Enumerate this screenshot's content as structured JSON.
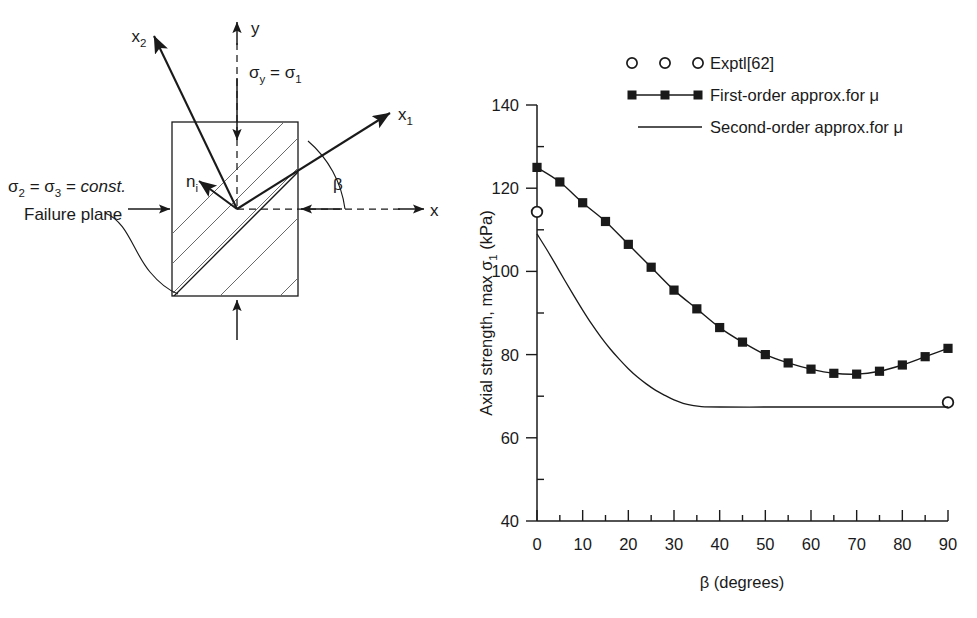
{
  "figure": {
    "background": "#ffffff",
    "line_color": "#1a1a1a",
    "hatch_color": "#6a6a6a"
  },
  "diagram": {
    "labels": {
      "x2": "x",
      "x2_sub": "2",
      "x1": "x",
      "x1_sub": "1",
      "y_axis": "y",
      "x_axis": "x",
      "sigma_y": "σ",
      "sigma_y_sub": "y",
      "sigma_y_eq": " = ",
      "sigma_1": "σ",
      "sigma_1_sub": "1",
      "sigma_2": "σ",
      "sigma_2_sub": "2",
      "eq1": " = ",
      "sigma_3": "σ",
      "sigma_3_sub": "3",
      "eq2": " = ",
      "const": "const.",
      "normal": "n",
      "normal_sub": "i",
      "beta": "β",
      "failure_plane": "Failure plane"
    }
  },
  "chart_data": {
    "type": "line",
    "title": "",
    "xlabel_text": "β (degrees)",
    "ylabel_parts": {
      "pre": "Axial strength, max ",
      "sigma": "σ",
      "sub": "1",
      "post": " (kPa)"
    },
    "xlim": [
      0,
      90
    ],
    "ylim": [
      40,
      140
    ],
    "xticks": [
      0,
      10,
      20,
      30,
      40,
      50,
      60,
      70,
      80,
      90
    ],
    "xtick_labels": [
      "0",
      "10",
      "20",
      "30",
      "40",
      "50",
      "60",
      "70",
      "80",
      "90"
    ],
    "xminor_step": 5,
    "yticks": [
      40,
      60,
      80,
      100,
      120,
      140
    ],
    "ytick_labels": [
      "40",
      "60",
      "80",
      "100",
      "120",
      "140"
    ],
    "yminor_step": 10,
    "grid": false,
    "legend_position": "top-right",
    "series": [
      {
        "name": "Exptl[62]",
        "style": "markers-only",
        "marker": "open-circle",
        "x": [
          0,
          90
        ],
        "values": [
          114.3,
          68.5
        ]
      },
      {
        "name": "First-order approx.for μ",
        "style": "line-markers",
        "marker": "filled-square",
        "x": [
          0,
          5,
          10,
          15,
          20,
          25,
          30,
          35,
          40,
          45,
          50,
          55,
          60,
          65,
          70,
          75,
          80,
          85,
          90
        ],
        "values": [
          125.0,
          121.5,
          116.5,
          112.0,
          106.5,
          101.0,
          95.5,
          91.0,
          86.5,
          83.0,
          80.0,
          78.0,
          76.5,
          75.5,
          75.3,
          76.0,
          77.5,
          79.5,
          81.5
        ]
      },
      {
        "name": "Second-order approx.for μ",
        "style": "line-only",
        "marker": "none",
        "x": [
          0,
          2,
          4,
          6,
          8,
          10,
          12,
          14,
          16,
          18,
          20,
          22,
          24,
          26,
          28,
          30,
          32,
          34,
          36,
          40,
          50,
          60,
          70,
          80,
          90
        ],
        "values": [
          109.0,
          105.5,
          101.8,
          98.0,
          94.3,
          90.7,
          87.3,
          84.2,
          81.4,
          78.9,
          76.6,
          74.6,
          72.9,
          71.4,
          70.2,
          69.1,
          68.3,
          67.8,
          67.5,
          67.4,
          67.4,
          67.4,
          67.4,
          67.4,
          67.4
        ]
      }
    ]
  }
}
